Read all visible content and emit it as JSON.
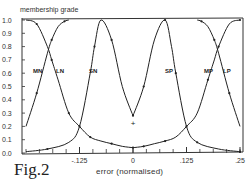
{
  "figure_label": "Fig.2",
  "chart_data": {
    "type": "line",
    "title": "",
    "xlabel": "error (normalised)",
    "ylabel": "membership grade",
    "xlim": [
      -0.25,
      0.25
    ],
    "ylim": [
      0.0,
      1.0
    ],
    "x_ticks": [
      "-.125",
      "0",
      ".125",
      ".25"
    ],
    "x_tick_values": [
      -0.125,
      0,
      0.125,
      0.25
    ],
    "y_ticks": [
      "0.0",
      "0.1",
      "0.2",
      "0.3",
      "0.4",
      "0.5",
      "0.6",
      "0.7",
      "0.8",
      "0.9",
      "1.0"
    ],
    "grid": false,
    "legend": "inline labels",
    "series": [
      {
        "name": "MN",
        "x": [
          -0.25,
          -0.225,
          -0.2,
          -0.19,
          -0.175,
          -0.16,
          -0.15
        ],
        "values": [
          0.2,
          0.45,
          0.75,
          0.85,
          0.95,
          0.99,
          1.0
        ]
      },
      {
        "name": "LN",
        "x": [
          -0.25,
          -0.225,
          -0.2,
          -0.19,
          -0.175,
          -0.15,
          -0.125,
          -0.1,
          -0.075,
          -0.05,
          -0.025,
          0.0
        ],
        "values": [
          1.0,
          0.97,
          0.8,
          0.7,
          0.55,
          0.3,
          0.2,
          0.12,
          0.09,
          0.07,
          0.05,
          0.04
        ]
      },
      {
        "name": "SN",
        "x": [
          -0.25,
          -0.2,
          -0.15,
          -0.125,
          -0.1,
          -0.09,
          -0.075,
          -0.05,
          -0.025,
          0.0
        ],
        "values": [
          0.01,
          0.03,
          0.08,
          0.2,
          0.6,
          0.8,
          1.0,
          0.85,
          0.5,
          0.28
        ]
      },
      {
        "name": "SP",
        "x": [
          0.0,
          0.025,
          0.05,
          0.075,
          0.09,
          0.1,
          0.125,
          0.15,
          0.2,
          0.25
        ],
        "values": [
          0.28,
          0.5,
          0.85,
          1.0,
          0.8,
          0.6,
          0.2,
          0.08,
          0.03,
          0.01
        ]
      },
      {
        "name": "MP",
        "x": [
          0.15,
          0.16,
          0.175,
          0.19,
          0.2,
          0.225,
          0.25
        ],
        "values": [
          1.0,
          0.99,
          0.95,
          0.85,
          0.75,
          0.45,
          0.2
        ]
      },
      {
        "name": "LP",
        "x": [
          0.0,
          0.025,
          0.05,
          0.075,
          0.1,
          0.125,
          0.15,
          0.175,
          0.19,
          0.2,
          0.225,
          0.25
        ],
        "values": [
          0.04,
          0.05,
          0.07,
          0.09,
          0.12,
          0.2,
          0.3,
          0.55,
          0.7,
          0.8,
          0.97,
          1.0
        ]
      }
    ],
    "annotations": [
      {
        "text": "+",
        "x": 0.0,
        "y": 0.22
      }
    ]
  }
}
